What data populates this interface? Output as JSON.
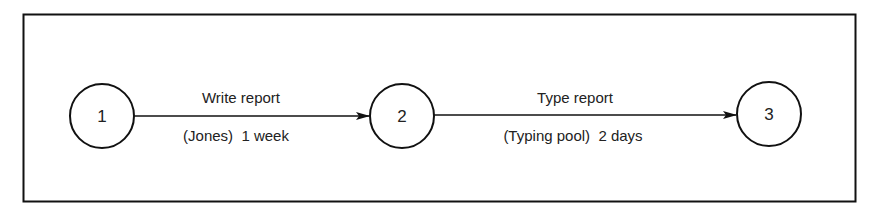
{
  "diagram": {
    "type": "activity-on-arrow network",
    "nodes": [
      {
        "id": "1",
        "label": "1"
      },
      {
        "id": "2",
        "label": "2"
      },
      {
        "id": "3",
        "label": "3"
      }
    ],
    "activities": [
      {
        "from": "1",
        "to": "2",
        "name": "Write report",
        "detail": "(Jones)  1 week"
      },
      {
        "from": "2",
        "to": "3",
        "name": "Type report",
        "detail": "(Typing pool)  2 days"
      }
    ],
    "colors": {
      "stroke": "#111111",
      "text": "#222222",
      "background": "#ffffff"
    }
  }
}
